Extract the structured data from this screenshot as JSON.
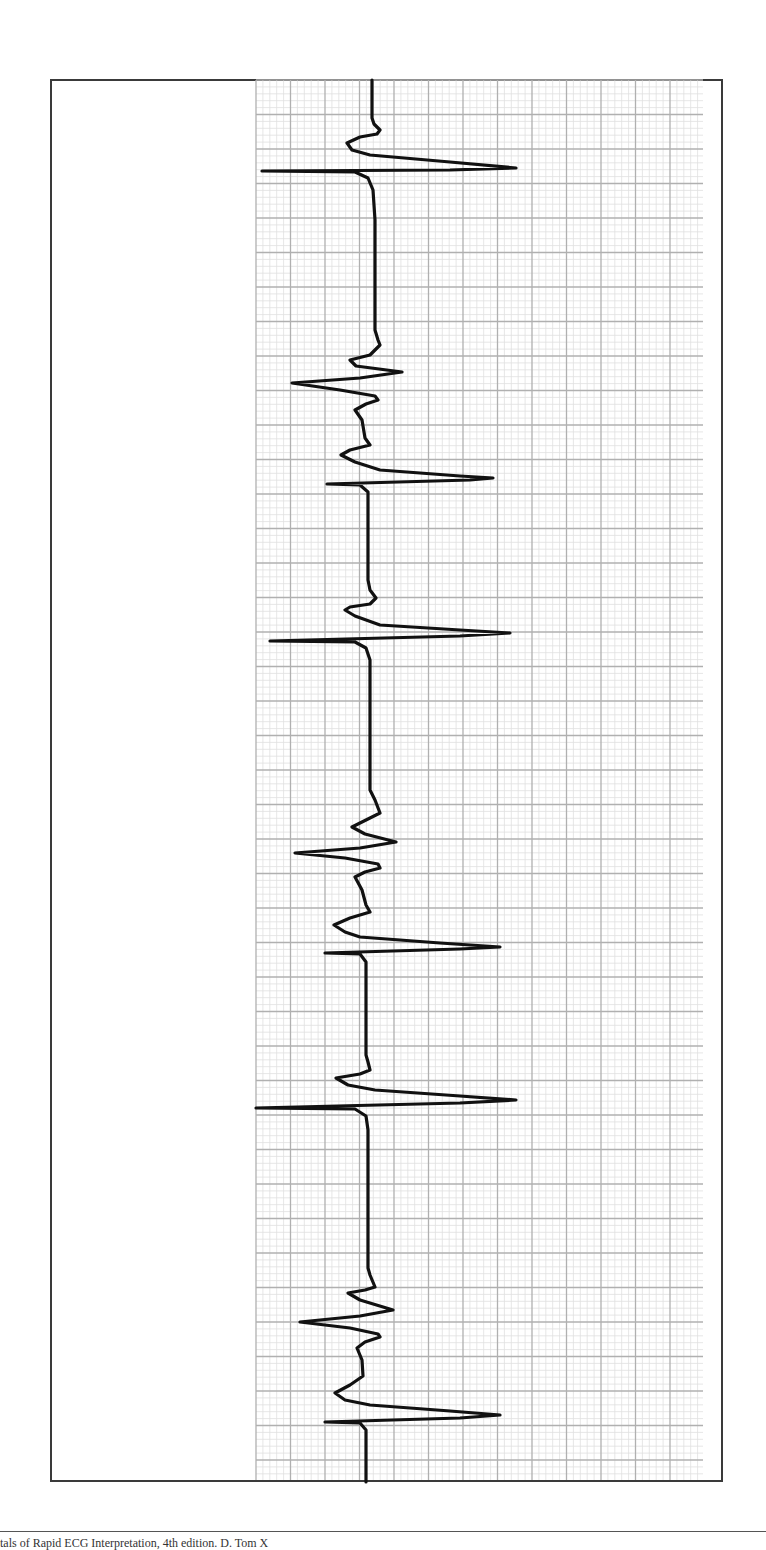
{
  "footer": {
    "caption": "tals of Rapid ECG Interpretation, 4th edition. D. Tom X"
  },
  "colors": {
    "frame": "#3a3a3a",
    "grid_major": "#b0b0b0",
    "grid_minor": "#e0e0e0",
    "trace": "#111111"
  },
  "chart_data": {
    "type": "line",
    "title": "",
    "xlabel": "",
    "ylabel": "",
    "orientation": "rotated-90 (time runs top to bottom, amplitude horizontal)",
    "grid": true,
    "grid_area": {
      "left": 256,
      "top": 80,
      "right": 703,
      "bottom": 1480,
      "major_px": 34.5,
      "minor_px": 6.9
    },
    "series": [
      {
        "name": "ECG trace",
        "points": [
          [
            372,
            80
          ],
          [
            372,
            118
          ],
          [
            374,
            124
          ],
          [
            380,
            130
          ],
          [
            377,
            134
          ],
          [
            360,
            137
          ],
          [
            347,
            143
          ],
          [
            352,
            150
          ],
          [
            370,
            155
          ],
          [
            450,
            162
          ],
          [
            516,
            168
          ],
          [
            450,
            170
          ],
          [
            262,
            171
          ],
          [
            355,
            172
          ],
          [
            368,
            178
          ],
          [
            373,
            190
          ],
          [
            375,
            220
          ],
          [
            375,
            330
          ],
          [
            378,
            340
          ],
          [
            380,
            345
          ],
          [
            370,
            355
          ],
          [
            350,
            360
          ],
          [
            356,
            366
          ],
          [
            402,
            372
          ],
          [
            360,
            378
          ],
          [
            292,
            383
          ],
          [
            340,
            390
          ],
          [
            375,
            396
          ],
          [
            378,
            400
          ],
          [
            366,
            404
          ],
          [
            355,
            410
          ],
          [
            362,
            420
          ],
          [
            365,
            438
          ],
          [
            370,
            445
          ],
          [
            350,
            450
          ],
          [
            341,
            455
          ],
          [
            355,
            462
          ],
          [
            380,
            470
          ],
          [
            460,
            476
          ],
          [
            493,
            478
          ],
          [
            470,
            480
          ],
          [
            327,
            484
          ],
          [
            360,
            485
          ],
          [
            368,
            492
          ],
          [
            368,
            580
          ],
          [
            370,
            590
          ],
          [
            376,
            598
          ],
          [
            370,
            604
          ],
          [
            350,
            607
          ],
          [
            345,
            610
          ],
          [
            355,
            616
          ],
          [
            380,
            625
          ],
          [
            460,
            630
          ],
          [
            510,
            633
          ],
          [
            460,
            636
          ],
          [
            270,
            641
          ],
          [
            355,
            642
          ],
          [
            366,
            648
          ],
          [
            370,
            660
          ],
          [
            370,
            790
          ],
          [
            375,
            800
          ],
          [
            380,
            813
          ],
          [
            370,
            818
          ],
          [
            352,
            827
          ],
          [
            365,
            834
          ],
          [
            396,
            842
          ],
          [
            360,
            848
          ],
          [
            295,
            853
          ],
          [
            345,
            858
          ],
          [
            378,
            864
          ],
          [
            380,
            868
          ],
          [
            365,
            872
          ],
          [
            355,
            877
          ],
          [
            362,
            890
          ],
          [
            366,
            905
          ],
          [
            370,
            912
          ],
          [
            350,
            918
          ],
          [
            334,
            925
          ],
          [
            345,
            932
          ],
          [
            360,
            937
          ],
          [
            440,
            943
          ],
          [
            500,
            947
          ],
          [
            460,
            949
          ],
          [
            325,
            953
          ],
          [
            360,
            954
          ],
          [
            366,
            962
          ],
          [
            366,
            1055
          ],
          [
            368,
            1062
          ],
          [
            370,
            1070
          ],
          [
            360,
            1074
          ],
          [
            336,
            1078
          ],
          [
            348,
            1085
          ],
          [
            375,
            1090
          ],
          [
            460,
            1096
          ],
          [
            516,
            1100
          ],
          [
            460,
            1103
          ],
          [
            256,
            1108
          ],
          [
            355,
            1109
          ],
          [
            366,
            1116
          ],
          [
            368,
            1130
          ],
          [
            368,
            1268
          ],
          [
            370,
            1275
          ],
          [
            375,
            1287
          ],
          [
            365,
            1290
          ],
          [
            348,
            1293
          ],
          [
            360,
            1300
          ],
          [
            393,
            1310
          ],
          [
            360,
            1316
          ],
          [
            300,
            1322
          ],
          [
            350,
            1328
          ],
          [
            378,
            1334
          ],
          [
            380,
            1337
          ],
          [
            365,
            1342
          ],
          [
            357,
            1348
          ],
          [
            362,
            1360
          ],
          [
            363,
            1376
          ],
          [
            350,
            1385
          ],
          [
            335,
            1393
          ],
          [
            345,
            1400
          ],
          [
            370,
            1405
          ],
          [
            450,
            1411
          ],
          [
            500,
            1415
          ],
          [
            460,
            1418
          ],
          [
            325,
            1422
          ],
          [
            360,
            1423
          ],
          [
            366,
            1430
          ],
          [
            366,
            1482
          ]
        ]
      }
    ],
    "beats": [
      {
        "type": "normal",
        "r_peak_y": 168,
        "r_x": 516,
        "s_x": 262
      },
      {
        "type": "fibrillatory-baseline+QRS",
        "r_peak_y": 478,
        "r_x": 493,
        "s_x": 327
      },
      {
        "type": "normal",
        "r_peak_y": 633,
        "r_x": 510,
        "s_x": 270
      },
      {
        "type": "fibrillatory-baseline+QRS",
        "r_peak_y": 947,
        "r_x": 500,
        "s_x": 325
      },
      {
        "type": "normal",
        "r_peak_y": 1100,
        "r_x": 516,
        "s_x": 256
      },
      {
        "type": "fibrillatory-baseline+QRS",
        "r_peak_y": 1415,
        "r_x": 500,
        "s_x": 325
      }
    ]
  }
}
